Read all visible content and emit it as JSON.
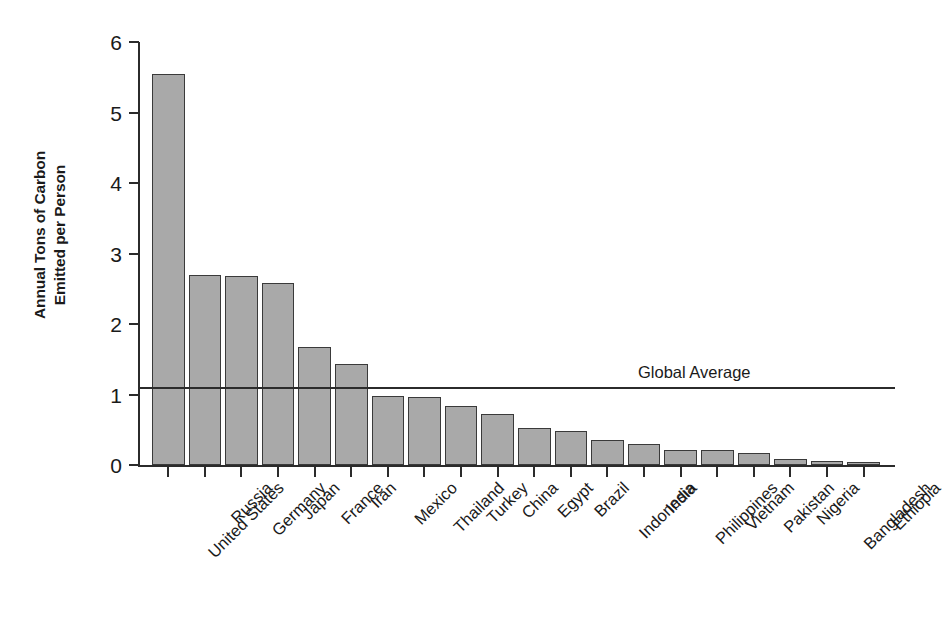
{
  "chart_data": {
    "type": "bar",
    "title": "",
    "subtitle": "",
    "xlabel": "",
    "ylabel": "Annual Tons of Carbon Emitted per Person",
    "ylabel_lines": [
      "Annual Tons of Carbon",
      "Emitted per Person"
    ],
    "ylim": [
      0,
      6
    ],
    "ytick_labels": [
      "0",
      "1",
      "2",
      "3",
      "4",
      "5",
      "6"
    ],
    "ytick_values": [
      0,
      1,
      2,
      3,
      4,
      5,
      6
    ],
    "grid": false,
    "legend_position": "none",
    "orientation": "vertical",
    "bar_color": "#a9a9a9",
    "bar_edge_color": "#3a3a3a",
    "axis_color": "#2b2b2b",
    "categories": [
      "United States",
      "Russia",
      "Germany",
      "Japan",
      "France",
      "Iran",
      "Mexico",
      "Thailand",
      "Turkey",
      "China",
      "Egypt",
      "Brazil",
      "Indonesia",
      "India",
      "Philippines",
      "Vietnam",
      "Pakistan",
      "Nigeria",
      "Bangladesh",
      "Ethiopia"
    ],
    "values": [
      5.55,
      2.7,
      2.68,
      2.58,
      1.67,
      1.43,
      0.98,
      0.97,
      0.84,
      0.72,
      0.53,
      0.48,
      0.35,
      0.3,
      0.22,
      0.21,
      0.17,
      0.08,
      0.05,
      0.02
    ],
    "annotations": [
      {
        "name": "global-average",
        "label": "Global Average",
        "value": 1.09,
        "type": "hline"
      }
    ]
  }
}
